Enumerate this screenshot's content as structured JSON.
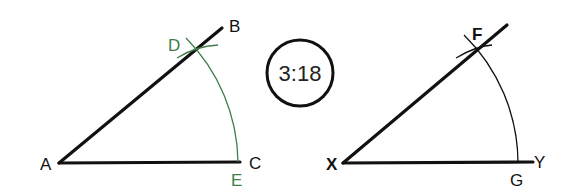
{
  "diagram": {
    "step_badge": {
      "text": "3:18"
    },
    "colors": {
      "line": "#111111",
      "construction": "#3f7d4a",
      "arc_right": "#111111"
    },
    "left_figure": {
      "labels": {
        "A": "A",
        "B": "B",
        "C": "C",
        "D": "D",
        "E": "E"
      },
      "points": {
        "A": [
          59,
          163
        ],
        "B": [
          222,
          28
        ],
        "C": [
          240,
          162
        ],
        "D": [
          197,
          48
        ],
        "E": [
          238,
          162
        ]
      }
    },
    "right_figure": {
      "labels": {
        "X": "X",
        "Y": "Y",
        "F": "F",
        "G": "G"
      },
      "points": {
        "X": [
          343,
          163
        ],
        "Y": [
          533,
          162
        ],
        "F": [
          477,
          49
        ],
        "G": [
          518,
          162
        ]
      }
    }
  }
}
